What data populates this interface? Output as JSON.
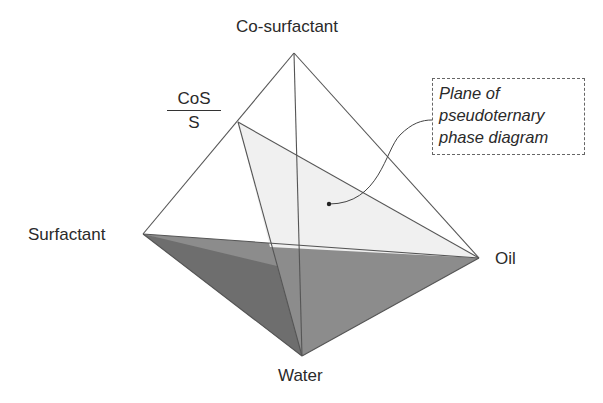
{
  "diagram": {
    "vertices": {
      "top": "Co-surfactant",
      "left": "Surfactant",
      "right": "Oil",
      "bottom": "Water"
    },
    "ratio_label": {
      "numerator": "CoS",
      "denominator": "S"
    },
    "callout": {
      "lines": [
        "Plane of",
        "pseudoternary",
        "phase diagram"
      ]
    },
    "colors": {
      "edge": "#555555",
      "plane_fill": "#f0f0f0",
      "bottom_face_dark": "#707070",
      "bottom_face_light": "#8c8c8c"
    }
  }
}
